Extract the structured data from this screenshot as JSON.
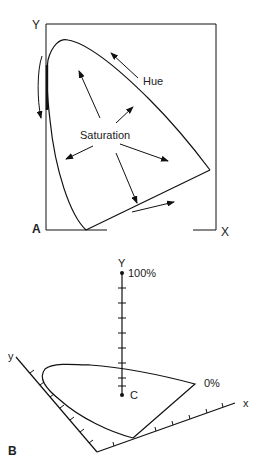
{
  "panel_a": {
    "label": "A",
    "axis_y": "Y",
    "axis_x": "X",
    "hue_label": "Hue",
    "saturation_label": "Saturation"
  },
  "panel_b": {
    "label": "B",
    "axis_Y": "Y",
    "axis_y": "y",
    "axis_x": "x",
    "top_value": "100%",
    "bottom_value": "0%",
    "center_point": "C",
    "tick_count_Y": 9
  },
  "colors": {
    "line": "#111111",
    "text": "#222222",
    "background": "#ffffff"
  }
}
